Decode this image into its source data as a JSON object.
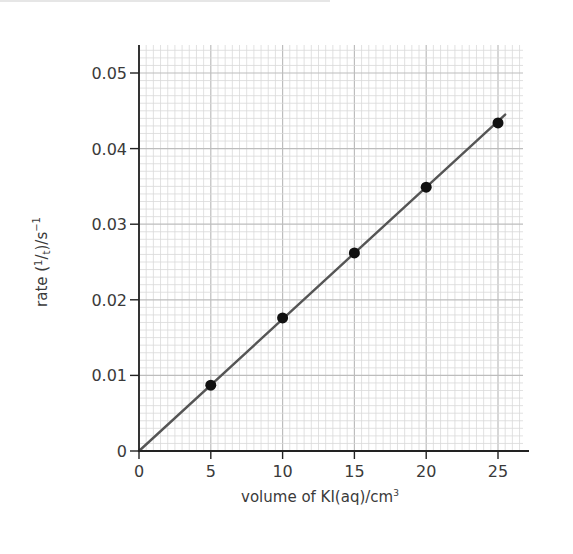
{
  "chart_data": {
    "type": "scatter",
    "title": "",
    "xlabel": "volume of KI(aq)/cm³",
    "ylabel": "rate (1/t)/s⁻¹",
    "ylabel_parts": {
      "pre": "rate (",
      "num": "1",
      "slash": "/",
      "den": "t",
      "post": ")/s",
      "sup": "−1"
    },
    "xlabel_parts": {
      "main": "volume of KI(aq)/cm",
      "sup": "3"
    },
    "x_ticks": [
      0,
      5,
      10,
      15,
      20,
      25
    ],
    "x_tick_labels": [
      "0",
      "5",
      "10",
      "15",
      "20",
      "25"
    ],
    "y_ticks": [
      0,
      0.01,
      0.02,
      0.03,
      0.04,
      0.05
    ],
    "y_tick_labels": [
      "0",
      "0.01",
      "0.02",
      "0.03",
      "0.04",
      "0.05"
    ],
    "xlim": [
      0,
      27
    ],
    "ylim": [
      0,
      0.0525
    ],
    "grid": true,
    "legend": null,
    "series": [
      {
        "name": "measured rate",
        "x": [
          5,
          10,
          15,
          20,
          25
        ],
        "y": [
          0.0087,
          0.0176,
          0.0262,
          0.0349,
          0.0434
        ],
        "marker": "filled-circle",
        "color": "#111111"
      }
    ],
    "best_fit_line": {
      "from": [
        0,
        0
      ],
      "to": [
        25.5,
        0.0445
      ],
      "color": "#555555"
    }
  },
  "colors": {
    "grid_minor": "#d9d9d9",
    "grid_major": "#bdbdbd",
    "axis": "#222222",
    "text": "#3a3a3a"
  }
}
